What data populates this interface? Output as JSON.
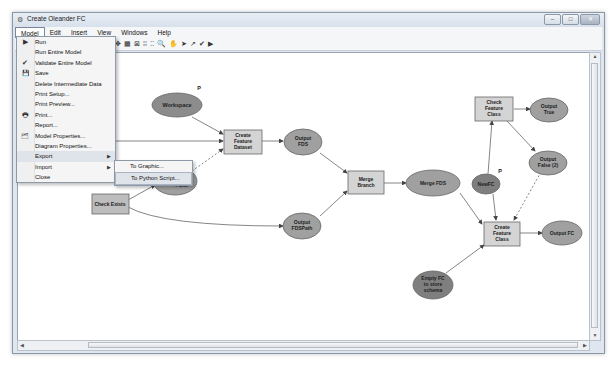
{
  "window": {
    "title": "Create Oleander FC",
    "controls": {
      "minimize": "–",
      "maximize": "□",
      "close": "✕"
    },
    "app_icon": "⚙"
  },
  "menubar": {
    "items": [
      {
        "label": "Model",
        "open": true
      },
      {
        "label": "Edit"
      },
      {
        "label": "Insert"
      },
      {
        "label": "View"
      },
      {
        "label": "Windows"
      },
      {
        "label": "Help"
      }
    ]
  },
  "toolbar": {
    "icons": [
      "✥",
      "▦",
      "⊠",
      "⁞⁞",
      "⁚⁚",
      "🔍",
      "✋",
      "➤",
      "↗",
      "✔",
      "▶"
    ]
  },
  "model_menu": {
    "items": [
      {
        "label": "Run",
        "icon": "▶",
        "has_submenu": false
      },
      {
        "label": "Run Entire Model",
        "icon": "",
        "has_submenu": false
      },
      {
        "label": "Validate Entire Model",
        "icon": "✔",
        "has_submenu": false
      },
      {
        "label": "Save",
        "icon": "💾",
        "has_submenu": false
      },
      {
        "label": "Delete Intermediate Data",
        "icon": "",
        "has_submenu": false
      },
      {
        "label": "Print Setup...",
        "icon": "",
        "has_submenu": false
      },
      {
        "label": "Print Preview...",
        "icon": "",
        "has_submenu": false
      },
      {
        "label": "Print...",
        "icon": "🖶",
        "has_submenu": false
      },
      {
        "label": "Report...",
        "icon": "",
        "has_submenu": false
      },
      {
        "label": "Model Properties...",
        "icon": "🗂",
        "has_submenu": false
      },
      {
        "label": "Diagram Properties...",
        "icon": "",
        "has_submenu": false
      },
      {
        "label": "Export",
        "icon": "",
        "has_submenu": true,
        "selected": true
      },
      {
        "label": "Import",
        "icon": "",
        "has_submenu": true
      },
      {
        "label": "Close",
        "icon": "",
        "has_submenu": false
      }
    ],
    "submenu_arrow": "▶"
  },
  "export_submenu": {
    "items": [
      {
        "label": "To Graphic..."
      },
      {
        "label": "To Python Script...",
        "selected": true
      }
    ]
  },
  "diagram": {
    "colors": {
      "ellipse_fill": "#9a9a9a",
      "ellipse_dark_fill": "#7d7d7d",
      "tool_fill": "#d4d4d4",
      "line": "#555555"
    },
    "nodes": {
      "workspace": {
        "label": "Workspace",
        "param": "P"
      },
      "create_feature_dataset": {
        "lines": [
          "Create",
          "Feature",
          "Dataset"
        ]
      },
      "output_fds": {
        "lines": [
          "Output",
          "FDS"
        ]
      },
      "false_node": {
        "label": "False"
      },
      "check_exists": {
        "label": "Check Exists"
      },
      "output_fdspath": {
        "lines": [
          "Output",
          "FDSPath"
        ]
      },
      "merge_branch": {
        "lines": [
          "Merge",
          "Branch"
        ]
      },
      "merge_fds": {
        "label": "Merge FDS"
      },
      "check_feature_class": {
        "lines": [
          "Check",
          "Feature",
          "Class"
        ]
      },
      "output_true": {
        "lines": [
          "Output",
          "True"
        ]
      },
      "output_false2": {
        "lines": [
          "Output",
          "False (2)"
        ]
      },
      "newfc": {
        "label": "NewFC",
        "param": "P"
      },
      "create_feature_class": {
        "lines": [
          "Create",
          "Feature",
          "Class"
        ]
      },
      "output_fc": {
        "label": "Output FC"
      },
      "empty_fc": {
        "lines": [
          "Empty FC",
          "to store",
          "schema"
        ]
      }
    }
  },
  "scrollbars": {
    "up": "▲",
    "down": "▼",
    "left": "◀",
    "right": "▶",
    "grip": "≡"
  }
}
